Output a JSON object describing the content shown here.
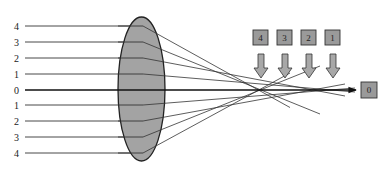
{
  "diagram": {
    "title": "",
    "type": "lens-spherical-aberration",
    "colors": {
      "lens_fill": "#a3a3a3",
      "lens_stroke": "#222222",
      "ray": "#333333",
      "axis": "#111111",
      "box_fill": "#9a9a9a",
      "box_stroke": "#333333",
      "arrow_fill": "#a8a8a8"
    },
    "ray_labels": [
      {
        "label": "4",
        "y": 26
      },
      {
        "label": "3",
        "y": 42
      },
      {
        "label": "2",
        "y": 58
      },
      {
        "label": "1",
        "y": 74
      },
      {
        "label": "0",
        "y": 90
      },
      {
        "label": "1",
        "y": 105
      },
      {
        "label": "2",
        "y": 121
      },
      {
        "label": "3",
        "y": 137
      },
      {
        "label": "4",
        "y": 153
      }
    ],
    "focus_boxes": [
      {
        "label": "4",
        "x": 253
      },
      {
        "label": "3",
        "x": 277
      },
      {
        "label": "2",
        "x": 301
      },
      {
        "label": "1",
        "x": 325
      }
    ],
    "axis_box": {
      "label": "0"
    }
  }
}
